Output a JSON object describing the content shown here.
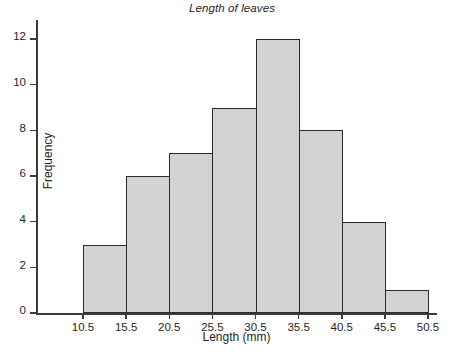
{
  "chart_data": {
    "type": "bar",
    "title": "Length of leaves",
    "xlabel": "Length (mm)",
    "ylabel": "Frequency",
    "grid": false,
    "legend": false,
    "bin_edges": [
      10.5,
      15.5,
      20.5,
      25.5,
      30.5,
      35.5,
      40.5,
      45.5,
      50.5
    ],
    "bin_width": 5,
    "categories": [
      "10.5-15.5",
      "15.5-20.5",
      "20.5-25.5",
      "25.5-30.5",
      "30.5-35.5",
      "35.5-40.5",
      "40.5-45.5",
      "45.5-50.5"
    ],
    "values": [
      3,
      6,
      7,
      9,
      12,
      8,
      4,
      1
    ],
    "xlim": [
      10.5,
      50.5
    ],
    "ylim": [
      0,
      12
    ],
    "x_ticks": [
      "10.5",
      "15.5",
      "20.5",
      "25.5",
      "30.5",
      "35.5",
      "40.5",
      "45.5",
      "50.5"
    ],
    "y_ticks": [
      "0",
      "2",
      "4",
      "6",
      "8",
      "10",
      "12"
    ],
    "bar_fill_color": "#d2d2d2",
    "bar_edge_color": "#2b2b2b",
    "axis_color": "#3c3c3c",
    "background_color": "#ffffff"
  },
  "axes": {
    "y_ticks": [
      {
        "label": "12",
        "value": 12
      },
      {
        "label": "10",
        "value": 10
      },
      {
        "label": "8",
        "value": 8
      },
      {
        "label": "6",
        "value": 6
      },
      {
        "label": "4",
        "value": 4
      },
      {
        "label": "2",
        "value": 2
      },
      {
        "label": "0",
        "value": 0
      }
    ],
    "x_ticks": [
      {
        "label": "10.5",
        "value": 10.5
      },
      {
        "label": "15.5",
        "value": 15.5
      },
      {
        "label": "20.5",
        "value": 20.5
      },
      {
        "label": "25.5",
        "value": 25.5
      },
      {
        "label": "30.5",
        "value": 30.5
      },
      {
        "label": "35.5",
        "value": 35.5
      },
      {
        "label": "40.5",
        "value": 40.5
      },
      {
        "label": "45.5",
        "value": 45.5
      },
      {
        "label": "50.5",
        "value": 50.5
      }
    ]
  },
  "bars": [
    {
      "label": "10.5-15.5",
      "value": 3,
      "start": 10.5,
      "end": 15.5
    },
    {
      "label": "15.5-20.5",
      "value": 6,
      "start": 15.5,
      "end": 20.5
    },
    {
      "label": "20.5-25.5",
      "value": 7,
      "start": 20.5,
      "end": 25.5
    },
    {
      "label": "25.5-30.5",
      "value": 9,
      "start": 25.5,
      "end": 30.5
    },
    {
      "label": "30.5-35.5",
      "value": 12,
      "start": 30.5,
      "end": 35.5
    },
    {
      "label": "35.5-40.5",
      "value": 8,
      "start": 35.5,
      "end": 40.5
    },
    {
      "label": "40.5-45.5",
      "value": 4,
      "start": 40.5,
      "end": 45.5
    },
    {
      "label": "45.5-50.5",
      "value": 1,
      "start": 45.5,
      "end": 50.5
    }
  ]
}
